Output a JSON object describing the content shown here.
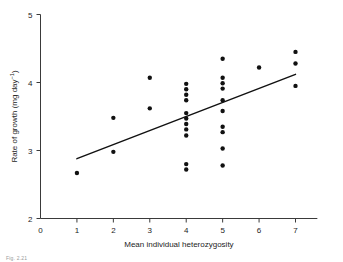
{
  "figure": {
    "caption": "Fig. 2.21",
    "background_color": "#ffffff",
    "ink_color": "#111111",
    "axis_color": "#3a3a3a"
  },
  "chart_data": {
    "type": "scatter",
    "title": "",
    "xlabel": "Mean individual heterozygosity",
    "ylabel_text": "Rate of growth (mg day",
    "ylabel_exponent": "−1",
    "ylabel_tail": ")",
    "ylabel_full": "Rate of growth (mg day⁻¹)",
    "xlim": [
      0,
      7.6
    ],
    "ylim": [
      2,
      5
    ],
    "xticks": [
      0,
      1,
      2,
      3,
      4,
      5,
      6,
      7
    ],
    "xtick_labels": [
      "0",
      "1",
      "2",
      "3",
      "4",
      "5",
      "6",
      "7"
    ],
    "yticks": [
      2,
      3,
      4,
      5
    ],
    "ytick_labels": [
      "2",
      "3",
      "4",
      "5"
    ],
    "grid": false,
    "legend": "none",
    "marker": "filled-circle",
    "marker_size_px": 4.4,
    "points": [
      {
        "x": 1,
        "y": 2.67
      },
      {
        "x": 2,
        "y": 3.48
      },
      {
        "x": 2,
        "y": 2.98
      },
      {
        "x": 3,
        "y": 4.07
      },
      {
        "x": 3,
        "y": 3.62
      },
      {
        "x": 4,
        "y": 3.98
      },
      {
        "x": 4,
        "y": 3.9
      },
      {
        "x": 4,
        "y": 3.82
      },
      {
        "x": 4,
        "y": 3.74
      },
      {
        "x": 4,
        "y": 3.55
      },
      {
        "x": 4,
        "y": 3.47
      },
      {
        "x": 4,
        "y": 3.39
      },
      {
        "x": 4,
        "y": 3.31
      },
      {
        "x": 4,
        "y": 3.22
      },
      {
        "x": 4,
        "y": 2.8
      },
      {
        "x": 4,
        "y": 2.72
      },
      {
        "x": 5,
        "y": 4.35
      },
      {
        "x": 5,
        "y": 4.07
      },
      {
        "x": 5,
        "y": 3.99
      },
      {
        "x": 5,
        "y": 3.91
      },
      {
        "x": 5,
        "y": 3.74
      },
      {
        "x": 5,
        "y": 3.58
      },
      {
        "x": 5,
        "y": 3.35
      },
      {
        "x": 5,
        "y": 3.27
      },
      {
        "x": 5,
        "y": 3.03
      },
      {
        "x": 5,
        "y": 2.78
      },
      {
        "x": 6,
        "y": 4.22
      },
      {
        "x": 7,
        "y": 4.45
      },
      {
        "x": 7,
        "y": 4.28
      },
      {
        "x": 7,
        "y": 3.95
      }
    ],
    "trend_line": {
      "type": "linear-regression",
      "x_start": 1.0,
      "y_start": 2.88,
      "x_end": 7.0,
      "y_end": 4.12
    }
  }
}
